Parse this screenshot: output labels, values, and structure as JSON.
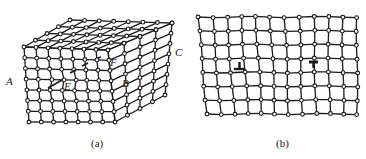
{
  "figure": {
    "panel_a": {
      "caption": "(a)",
      "description": "Edge dislocation in a 3D crystal lattice block",
      "labels": {
        "A": "A",
        "B": "B",
        "C": "C",
        "E": "E",
        "F": "F"
      },
      "grid": {
        "front_cols": 7,
        "front_rows": 7,
        "depth": 4
      }
    },
    "panel_b": {
      "caption": "(b)",
      "description": "2D lattice with a pair of opposite-sign edge dislocations",
      "symbols": [
        "positive-edge-dislocation",
        "negative-edge-dislocation"
      ],
      "grid": {
        "cols": 12,
        "rows": 8
      }
    },
    "colors": {
      "line": "#1a1a1a",
      "background": "#ffffff"
    }
  }
}
